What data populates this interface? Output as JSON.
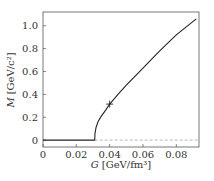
{
  "chart_data": {
    "type": "line",
    "title": "",
    "xlabel": "G [GeV/fm³]",
    "xlabel_var": "G",
    "xlabel_unit": "[GeV/fm³]",
    "ylabel": "M [GeV/c²]",
    "ylabel_var": "M",
    "ylabel_unit": "[GeV/c²]",
    "xlim": [
      0,
      0.0936
    ],
    "ylim": [
      -0.06,
      1.12
    ],
    "xticks": [
      0,
      0.02,
      0.04,
      0.06,
      0.08
    ],
    "xtick_labels": [
      "0",
      "0.02",
      "0.04",
      "0.06",
      "0.08"
    ],
    "yticks": [
      0,
      0.2,
      0.4,
      0.6,
      0.8,
      1.0
    ],
    "ytick_labels": [
      "0",
      "0.2",
      "0.4",
      "0.6",
      "0.8",
      "1.0"
    ],
    "grid": false,
    "series": [
      {
        "name": "M(G)",
        "style": "solid",
        "color": "#222222",
        "x": [
          0,
          0.031,
          0.0312,
          0.0318,
          0.033,
          0.035,
          0.0375,
          0.04,
          0.045,
          0.05,
          0.06,
          0.07,
          0.08,
          0.092
        ],
        "y": [
          0,
          0,
          0.06,
          0.11,
          0.16,
          0.21,
          0.26,
          0.315,
          0.4,
          0.48,
          0.63,
          0.78,
          0.92,
          1.06
        ]
      },
      {
        "name": "M = 0 (dashed)",
        "style": "dashed",
        "color": "#999999",
        "x": [
          0.031,
          0.0936
        ],
        "y": [
          0,
          0
        ]
      }
    ],
    "markers": [
      {
        "label": "+",
        "x": 0.04,
        "y": 0.315
      }
    ]
  },
  "colors": {
    "frame": "#555555",
    "curve": "#222222",
    "dashed": "#999999",
    "text": "#333333"
  }
}
